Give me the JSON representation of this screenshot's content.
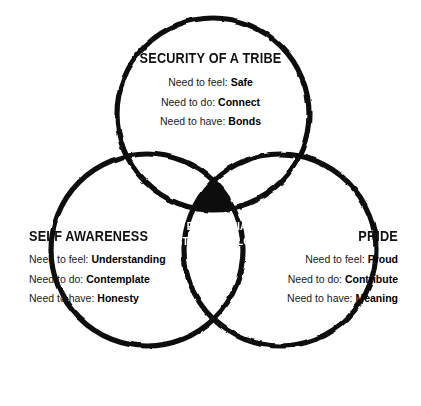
{
  "diagram": {
    "type": "venn-3-circle",
    "title_visible": false,
    "colors": {
      "stroke": "#111111",
      "background": "#ffffff",
      "intersection_fill": "#111111",
      "intersection_text": "#ffffff",
      "body_text": "#1a1a1a"
    },
    "circles": [
      {
        "id": "tribe",
        "label": "SECURITY OF A TRIBE",
        "cx": 213,
        "cy": 114,
        "r": 96
      },
      {
        "id": "self",
        "label": "SELF AWARENESS",
        "cx": 147,
        "cy": 250,
        "r": 96
      },
      {
        "id": "pride",
        "label": "PRIDE",
        "cx": 280,
        "cy": 250,
        "r": 96
      }
    ],
    "sets": {
      "tribe": {
        "heading": "SECURITY OF A TRIBE",
        "rows": [
          {
            "prefix": "Need to feel:",
            "value": "Safe"
          },
          {
            "prefix": "Need to do:",
            "value": "Connect"
          },
          {
            "prefix": "Need to have:",
            "value": "Bonds"
          }
        ]
      },
      "self": {
        "heading": "SELF AWARENESS",
        "rows": [
          {
            "prefix": "Need to feel:",
            "value": "Understanding"
          },
          {
            "prefix": "Need to do:",
            "value": "Contemplate"
          },
          {
            "prefix": "Need to have:",
            "value": "Honesty"
          }
        ]
      },
      "pride": {
        "heading": "PRIDE",
        "rows": [
          {
            "prefix": "Need to feel:",
            "value": "Proud"
          },
          {
            "prefix": "Need to do:",
            "value": "Contribute"
          },
          {
            "prefix": "Need to have:",
            "value": "Meaning"
          }
        ]
      }
    },
    "intersection": {
      "line1": "EUDEMONIA",
      "line2": "STRESS TEFLON"
    }
  }
}
